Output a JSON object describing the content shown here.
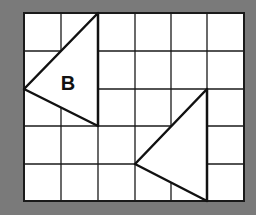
{
  "background_color": "#7a7a7a",
  "grid": {
    "columns": 6,
    "rows": 5,
    "x_lines": [
      24,
      61,
      98,
      135,
      171,
      207,
      244
    ],
    "y_lines": [
      13,
      51,
      89,
      126,
      164,
      201
    ],
    "fill": "#ffffff",
    "line_color": "#1a1a1a"
  },
  "shapes": [
    {
      "name": "triangle-b",
      "label": "B",
      "grid_vertices": [
        [
          2,
          0
        ],
        [
          0,
          2
        ],
        [
          2,
          3
        ]
      ],
      "points": "98,13 24,89 98,126",
      "label_pos": [
        68,
        90
      ]
    },
    {
      "name": "triangle-image",
      "label": "",
      "grid_vertices": [
        [
          5,
          2
        ],
        [
          3,
          4
        ],
        [
          5,
          5
        ]
      ],
      "points": "207,89 135,164 207,201"
    }
  ]
}
